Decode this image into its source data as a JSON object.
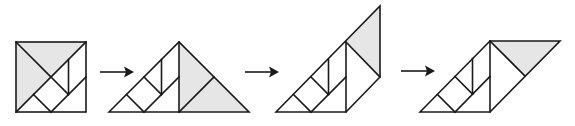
{
  "diagram": {
    "colors": {
      "stroke": "#1a1a1a",
      "shaded": "#e6e6e6",
      "background": "#ffffff"
    },
    "steps": [
      {
        "id": "step-1",
        "shape": "square"
      },
      {
        "id": "step-2",
        "shape": "triangle"
      },
      {
        "id": "step-3",
        "shape": "trapezoid-with-triangle"
      },
      {
        "id": "step-4",
        "shape": "parallelogram"
      }
    ],
    "arrows": [
      {
        "from": "step-1",
        "to": "step-2"
      },
      {
        "from": "step-2",
        "to": "step-3"
      },
      {
        "from": "step-3",
        "to": "step-4"
      }
    ]
  }
}
